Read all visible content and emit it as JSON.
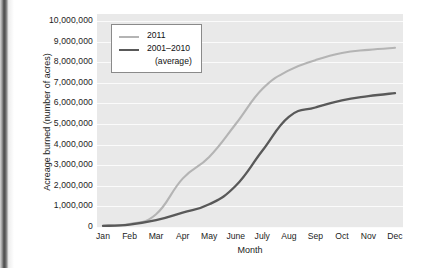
{
  "chart_data": {
    "type": "line",
    "title": "",
    "xlabel": "Month",
    "ylabel": "Acreage burned (number of acres)",
    "categories": [
      "Jan",
      "Feb",
      "Mar",
      "Apr",
      "May",
      "June",
      "July",
      "Aug",
      "Sep",
      "Oct",
      "Nov",
      "Dec"
    ],
    "ylim": [
      0,
      10000000
    ],
    "ytick_labels": [
      "10,000,000",
      "9,000,000",
      "8,000,000",
      "7,000,000",
      "6,000,000",
      "5,000,000",
      "4,000,000",
      "3,000,000",
      "2,000,000",
      "1,000,000",
      "0"
    ],
    "ytick_values": [
      10000000,
      9000000,
      8000000,
      7000000,
      6000000,
      5000000,
      4000000,
      3000000,
      2000000,
      1000000,
      0
    ],
    "grid": true,
    "legend_position": "top-left-inside",
    "series": [
      {
        "name": "2011",
        "color": "#b4b4b4",
        "values": [
          60000,
          150000,
          620000,
          2350000,
          3400000,
          5000000,
          6700000,
          7600000,
          8100000,
          8450000,
          8600000,
          8700000
        ]
      },
      {
        "name": "2001–2010 (average)",
        "color": "#595959",
        "values": [
          50000,
          120000,
          330000,
          700000,
          1100000,
          2000000,
          3700000,
          5350000,
          5800000,
          6150000,
          6350000,
          6500000
        ]
      }
    ]
  },
  "legend": {
    "entries": [
      {
        "label": "2011",
        "sublabel": ""
      },
      {
        "label": "2001–2010",
        "sublabel": "(average)"
      }
    ]
  },
  "colors": {
    "plot_background": "#e9e9e9",
    "gridline": "#fbfbfb",
    "series_2011": "#b4b4b4",
    "series_average": "#595959",
    "text": "#1c1c1c"
  }
}
